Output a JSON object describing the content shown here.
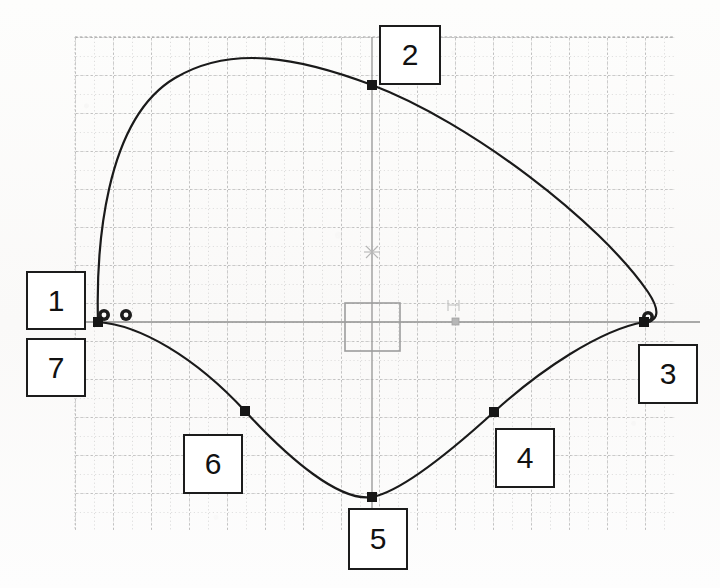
{
  "document": {
    "kind": "cad-spline-diagram",
    "title": "Closed spline with 7 numbered control points",
    "background_color": "#fcfcfb"
  },
  "canvas": {
    "width": 720,
    "height": 588,
    "grid": {
      "left": 75,
      "top": 37,
      "right": 675,
      "bottom": 530,
      "major_spacing": 38,
      "minor_spacing": 19,
      "major_color": "#9a9a9a",
      "minor_color": "#b9b9b9",
      "style": "dashed-dotted"
    },
    "axes": {
      "horizontal_y": 322,
      "vertical_x": 372,
      "color": "#8e8e8e",
      "x_extent": [
        75,
        700
      ],
      "y_extent": [
        37,
        530
      ]
    },
    "curve": {
      "color": "#1a1a1a",
      "width": 2.2,
      "closed": true
    },
    "origin_marker": {
      "x": 372,
      "y": 252,
      "glyph": "asterisk",
      "color": "#b4b4b4"
    },
    "selection_rect": {
      "x": 345,
      "y": 303,
      "width": 55,
      "height": 48,
      "color": "#9d9d9d"
    },
    "axis_handle": {
      "x": 455,
      "y": 321,
      "size": 7,
      "color": "#b0b0b0"
    },
    "height_symbol": {
      "x": 452,
      "y": 304,
      "glyph": "H",
      "color": "#c2c2c2"
    }
  },
  "chart_data": {
    "type": "scatter",
    "xlabel": "",
    "ylabel": "",
    "grid": true,
    "legend": null,
    "points": [
      {
        "id": 1,
        "label": "1",
        "x": 98,
        "y": 322,
        "marker": "filled-square",
        "note": "left endpoint on horizontal axis"
      },
      {
        "id": 2,
        "label": "2",
        "x": 372,
        "y": 85,
        "marker": "filled-square",
        "note": "top point on vertical axis"
      },
      {
        "id": 3,
        "label": "3",
        "x": 644,
        "y": 322,
        "marker": "filled-square",
        "note": "right endpoint on horizontal axis"
      },
      {
        "id": 4,
        "label": "4",
        "x": 494,
        "y": 412,
        "marker": "filled-square",
        "note": "lower right control point"
      },
      {
        "id": 5,
        "label": "5",
        "x": 372,
        "y": 497,
        "marker": "filled-square",
        "note": "bottom point on vertical axis"
      },
      {
        "id": 6,
        "label": "6",
        "x": 245,
        "y": 411,
        "marker": "filled-square",
        "note": "lower left control point"
      },
      {
        "id": 7,
        "label": "7",
        "x": 98,
        "y": 322,
        "marker": "filled-square",
        "note": "coincident with point 1, start/end of closed spline"
      }
    ],
    "ring_markers": [
      {
        "x": 104,
        "y": 315,
        "outer_r": 6,
        "inner_r": 2.4
      },
      {
        "x": 126,
        "y": 315,
        "outer_r": 6,
        "inner_r": 2.4
      },
      {
        "x": 648,
        "y": 317,
        "outer_r": 6,
        "inner_r": 2.4
      }
    ],
    "path": "M 98,322 C 96,250 104,120 175,78 C 232,44 300,58 372,85 C 470,122 600,222 648,292 C 664,316 654,322 644,322 C 600,330 540,370 494,412 C 450,452 400,492 372,497 C 340,502 290,460 245,411 C 195,357 140,325 98,322 Z",
    "xlim": [
      75,
      675
    ],
    "ylim": [
      37,
      530
    ]
  },
  "labels": [
    {
      "text": "1",
      "x": 26,
      "y": 271,
      "w": 60,
      "h": 59,
      "for_point": 1
    },
    {
      "text": "2",
      "x": 379,
      "y": 25,
      "w": 62,
      "h": 60,
      "for_point": 2
    },
    {
      "text": "3",
      "x": 638,
      "y": 344,
      "w": 60,
      "h": 60,
      "for_point": 3
    },
    {
      "text": "4",
      "x": 495,
      "y": 428,
      "w": 60,
      "h": 60,
      "for_point": 4
    },
    {
      "text": "5",
      "x": 348,
      "y": 508,
      "w": 60,
      "h": 62,
      "for_point": 5
    },
    {
      "text": "6",
      "x": 183,
      "y": 434,
      "w": 60,
      "h": 60,
      "for_point": 6
    },
    {
      "text": "7",
      "x": 26,
      "y": 338,
      "w": 60,
      "h": 59,
      "for_point": 7
    }
  ]
}
